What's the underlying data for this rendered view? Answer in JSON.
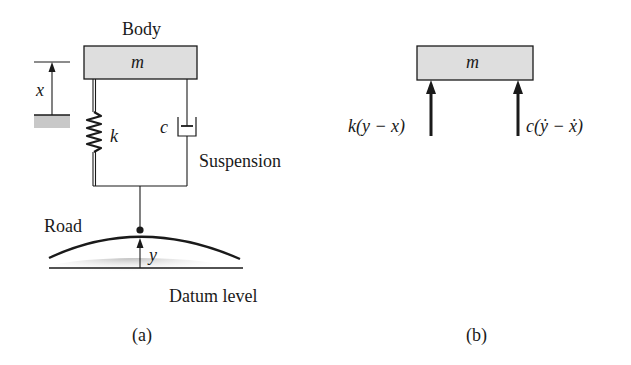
{
  "figure_a": {
    "caption": "(a)",
    "body_label": "Body",
    "mass_label": "m",
    "displacement_body": "x",
    "spring_label": "k",
    "damper_label": "c",
    "suspension_label": "Suspension",
    "road_label": "Road",
    "displacement_road": "y",
    "datum_label": "Datum level"
  },
  "figure_b": {
    "caption": "(b)",
    "mass_label": "m",
    "spring_force": "k(y − x)",
    "damper_force": "c(ẏ − ẋ)"
  },
  "colors": {
    "mass_fill": "#dedede",
    "stroke": "#1a1a1a",
    "ground_shade": "#c8c8c8"
  }
}
